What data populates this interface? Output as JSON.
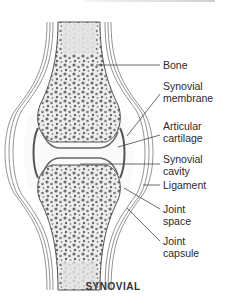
{
  "figure": {
    "title": "SYNOVIAL",
    "labels": [
      {
        "id": "bone",
        "text": "Bone"
      },
      {
        "id": "synovial-membrane",
        "text": "Synovial\nmembrane"
      },
      {
        "id": "articular-cartilage",
        "text": "Articular\ncartilage"
      },
      {
        "id": "synovial-cavity",
        "text": "Synovial\ncavity"
      },
      {
        "id": "ligament",
        "text": "Ligament"
      },
      {
        "id": "joint-space",
        "text": "Joint\nspace"
      },
      {
        "id": "joint-capsule",
        "text": "Joint\ncapsule"
      }
    ],
    "colors": {
      "bone_fill": "#ececec",
      "trabeculae": "#6f6f6f",
      "outline": "#555555",
      "leader_line": "#444444"
    }
  }
}
